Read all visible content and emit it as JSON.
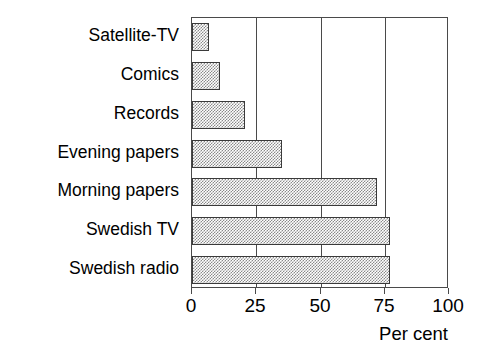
{
  "chart_data": {
    "type": "bar",
    "orientation": "horizontal",
    "title": "",
    "title_note": "title is cropped off the top edge of the screenshot",
    "categories": [
      "Satellite-TV",
      "Comics",
      "Records",
      "Evening papers",
      "Morning papers",
      "Swedish TV",
      "Swedish radio"
    ],
    "values": [
      6.5,
      11,
      20.5,
      35,
      72,
      77,
      77
    ],
    "series": [
      {
        "name": "Per cent",
        "values": [
          6.5,
          11,
          20.5,
          35,
          72,
          77,
          77
        ]
      }
    ],
    "xlabel": "Per cent",
    "ylabel": "",
    "xlim": [
      0,
      100
    ],
    "xticks": [
      0,
      25,
      50,
      75,
      100
    ],
    "xticklabels": [
      "0",
      "25",
      "50",
      "75",
      "100"
    ],
    "grid": "vertical gridlines at each x tick",
    "legend": "none",
    "bar_fill": "50% gray checkerboard dither with black outline"
  },
  "axis": {
    "title": "Per cent",
    "ticks": [
      "0",
      "25",
      "50",
      "75",
      "100"
    ]
  },
  "colors": {
    "background": "#ffffff",
    "frame": "#4a4a4a",
    "bar_outline": "#3a3a3a",
    "bar_fill": "#8a8a8a",
    "text": "#000000"
  }
}
